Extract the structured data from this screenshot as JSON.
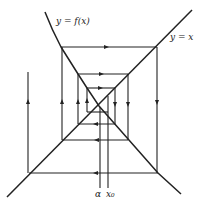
{
  "diagram": {
    "type": "cobweb diagram (fixed-point iteration, divergent spiral)",
    "labels": {
      "curve": "y = f(x)",
      "line": "y = x",
      "fixed_point": "α",
      "start": "x₀"
    },
    "colors": {
      "stroke": "#222222",
      "background": "#ffffff"
    }
  }
}
